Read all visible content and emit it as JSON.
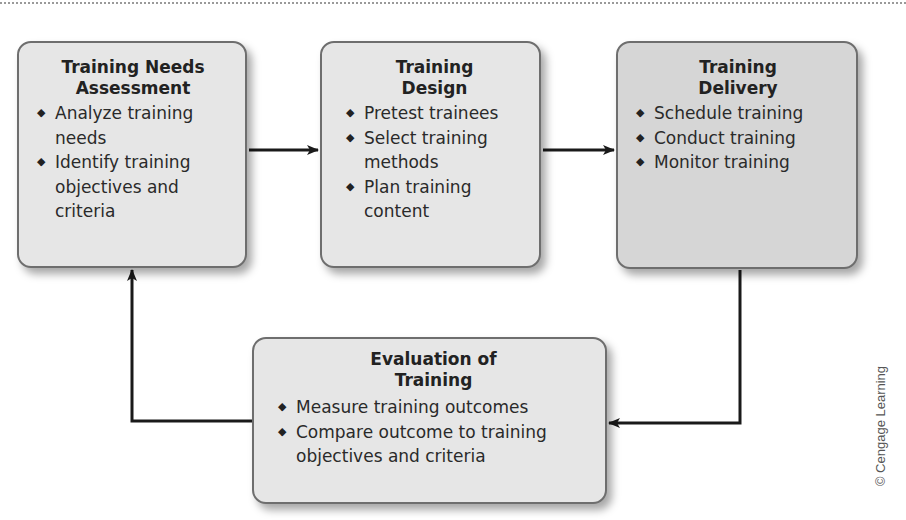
{
  "diagram": {
    "type": "training process cycle",
    "boxes": [
      {
        "id": "needs-assessment",
        "title_lines": [
          "Training Needs",
          "Assessment"
        ],
        "items": [
          "Analyze training needs",
          "Identify training objectives and criteria"
        ]
      },
      {
        "id": "design",
        "title_lines": [
          "Training",
          "Design"
        ],
        "items": [
          "Pretest trainees",
          "Select training methods",
          "Plan training content"
        ]
      },
      {
        "id": "delivery",
        "title_lines": [
          "Training",
          "Delivery"
        ],
        "items": [
          "Schedule training",
          "Conduct training",
          "Monitor training"
        ]
      },
      {
        "id": "evaluation",
        "title_lines": [
          "Evaluation of",
          "Training"
        ],
        "items": [
          "Measure training outcomes",
          "Compare outcome to training objectives and criteria"
        ]
      }
    ],
    "flows": [
      {
        "from": "needs-assessment",
        "to": "design"
      },
      {
        "from": "design",
        "to": "delivery"
      },
      {
        "from": "delivery",
        "to": "evaluation"
      },
      {
        "from": "evaluation",
        "to": "needs-assessment"
      }
    ],
    "bullet_glyph": "◆",
    "colors": {
      "box_fill": "#e6e6e6",
      "box_fill_dark": "#d6d6d6",
      "box_border": "#6e6e6e",
      "arrow": "#1a1a1a"
    }
  },
  "credit": "© Cengage Learning"
}
